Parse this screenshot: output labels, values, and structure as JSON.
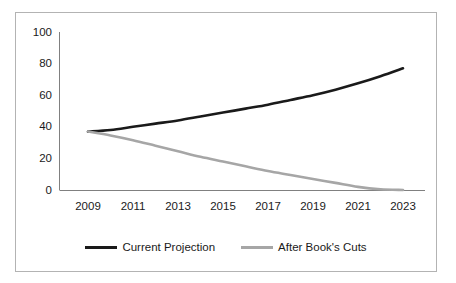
{
  "chart_data": {
    "type": "line",
    "title": "",
    "xlabel": "",
    "ylabel": "",
    "x": [
      2009,
      2010,
      2011,
      2012,
      2013,
      2014,
      2015,
      2016,
      2017,
      2018,
      2019,
      2020,
      2021,
      2022,
      2023
    ],
    "xtick_labels": [
      "2009",
      "2011",
      "2013",
      "2015",
      "2017",
      "2019",
      "2021",
      "2023"
    ],
    "xtick_values": [
      2009,
      2011,
      2013,
      2015,
      2017,
      2019,
      2021,
      2023
    ],
    "ytick_labels": [
      "0",
      "20",
      "40",
      "60",
      "80",
      "100"
    ],
    "ytick_values": [
      0,
      20,
      40,
      60,
      80,
      100
    ],
    "xlim": [
      2008,
      2024
    ],
    "ylim": [
      0,
      100
    ],
    "grid": false,
    "legend_position": "bottom",
    "series": [
      {
        "name": "Current Projection",
        "color": "#1a1a1a",
        "values": [
          37,
          38,
          40,
          42,
          44,
          46.5,
          49,
          51.5,
          54,
          57,
          60,
          63.5,
          67.5,
          72,
          77
        ]
      },
      {
        "name": "After Book's Cuts",
        "color": "#a6a6a6",
        "values": [
          37,
          34.5,
          31.5,
          28,
          24.5,
          21,
          18,
          15,
          12,
          9.5,
          7,
          4.5,
          2,
          0.5,
          0
        ]
      }
    ]
  },
  "legend": {
    "items": [
      {
        "label": "Current Projection"
      },
      {
        "label": "After Book's Cuts"
      }
    ]
  }
}
